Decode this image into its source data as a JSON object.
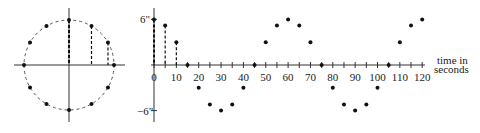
{
  "circle": {
    "points_angles_deg": [
      90,
      60,
      30,
      0,
      -30,
      -60,
      -90,
      -120,
      -150,
      180,
      150,
      120
    ]
  },
  "chart_data": {
    "type": "scatter",
    "title": "",
    "xlabel": "time in seconds",
    "ylabel": "",
    "x": [
      0,
      5,
      10,
      15,
      20,
      25,
      30,
      35,
      40,
      45,
      50,
      55,
      60,
      65,
      70,
      75,
      80,
      85,
      90,
      95,
      100,
      105,
      110,
      115,
      120
    ],
    "values": [
      6,
      5.2,
      3,
      0,
      -3,
      -5.2,
      -6,
      -5.2,
      -3,
      0,
      3,
      5.2,
      6,
      5.2,
      3,
      0,
      -3,
      -5.2,
      -6,
      -5.2,
      -3,
      0,
      3,
      5.2,
      6
    ],
    "xticks": [
      0,
      10,
      20,
      30,
      40,
      50,
      60,
      70,
      80,
      90,
      100,
      110,
      120
    ],
    "ytick_labels": [
      "6\"",
      "-6\""
    ],
    "ylim": [
      -6,
      6
    ],
    "xlim": [
      0,
      120
    ]
  },
  "labels": {
    "ymax": "6\"",
    "ymin": "−6\"",
    "xlabel1": "time in",
    "xlabel2": "seconds"
  }
}
